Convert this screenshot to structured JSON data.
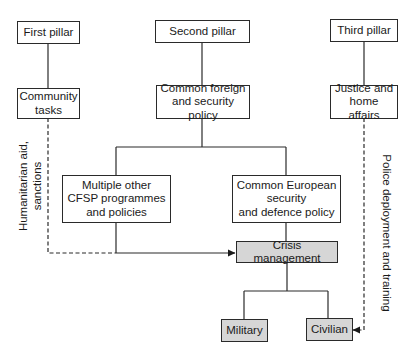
{
  "diagram": {
    "nodes": {
      "first_pillar": {
        "label": "First pillar"
      },
      "second_pillar": {
        "label": "Second pillar"
      },
      "third_pillar": {
        "label": "Third pillar"
      },
      "community_tasks": {
        "label": "Community\ntasks"
      },
      "cfsp": {
        "label": "Common foreign\nand security policy"
      },
      "jha": {
        "label": "Justice and\nhome affairs"
      },
      "multiple_other": {
        "label": "Multiple other\nCFSP programmes\nand policies"
      },
      "cesdp": {
        "label": "Common European\nsecurity\nand defence policy"
      },
      "crisis_management": {
        "label": "Crisis management"
      },
      "military": {
        "label": "Military"
      },
      "civilian": {
        "label": "Civilian"
      }
    },
    "edge_labels": {
      "left": "Humanitarian aid,\nsanctions",
      "right": "Police deployment and training"
    },
    "edges": [
      {
        "from": "First pillar",
        "to": "Community tasks",
        "style": "solid"
      },
      {
        "from": "Second pillar",
        "to": "Common foreign and security policy",
        "style": "solid"
      },
      {
        "from": "Third pillar",
        "to": "Justice and home affairs",
        "style": "solid"
      },
      {
        "from": "Common foreign and security policy",
        "to": "Multiple other CFSP programmes and policies",
        "style": "solid"
      },
      {
        "from": "Common foreign and security policy",
        "to": "Common European security and defence policy",
        "style": "solid"
      },
      {
        "from": "Common European security and defence policy",
        "to": "Crisis management",
        "style": "solid"
      },
      {
        "from": "Multiple other CFSP programmes and policies",
        "to": "Crisis management",
        "style": "solid-arrow"
      },
      {
        "from": "Community tasks",
        "to": "Crisis management",
        "style": "dashed-arrow",
        "label": "Humanitarian aid, sanctions"
      },
      {
        "from": "Crisis management",
        "to": "Military",
        "style": "solid"
      },
      {
        "from": "Crisis management",
        "to": "Civilian",
        "style": "solid"
      },
      {
        "from": "Justice and home affairs",
        "to": "Civilian",
        "style": "dashed-arrow",
        "label": "Police deployment and training"
      }
    ],
    "colors": {
      "line": "#2a2a2a",
      "highlight_fill": "#d6d6d6",
      "background": "#ffffff"
    }
  }
}
